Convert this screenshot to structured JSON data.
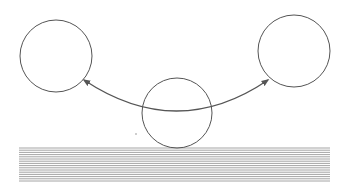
{
  "diagram": {
    "colors": {
      "background": "#ffffff",
      "stroke": "#555555",
      "hatch": "#9a9a9a"
    },
    "balls": [
      {
        "id": "left",
        "cx": 56,
        "cy": 56,
        "r": 36
      },
      {
        "id": "center",
        "cx": 177,
        "cy": 113,
        "r": 35
      },
      {
        "id": "right",
        "cx": 294,
        "cy": 51,
        "r": 36
      }
    ],
    "arc": {
      "start": [
        84,
        80
      ],
      "control": [
        177,
        142
      ],
      "end": [
        268,
        80
      ],
      "heads": [
        "start",
        "end"
      ]
    },
    "surface": {
      "x": 19,
      "y": 148,
      "width": 311,
      "height": 35,
      "line_spacing": 2.2
    },
    "dot": {
      "cx": 136,
      "cy": 134,
      "r": 0.7
    }
  }
}
